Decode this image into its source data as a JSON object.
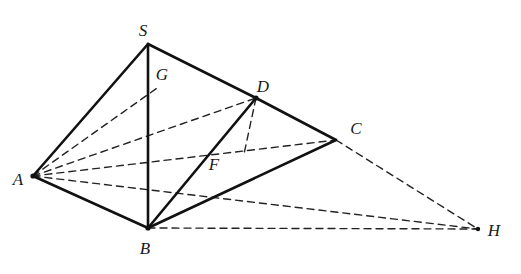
{
  "figure": {
    "title": "",
    "type": "geometry-diagram",
    "stroke_color": "#111111",
    "dashed_color": "#222222",
    "background": "#ffffff",
    "solid_width": 2.6,
    "dashed_width": 1.4,
    "dash_pattern": "7,5",
    "points": {
      "S": {
        "x": 148,
        "y": 44,
        "label": "S",
        "label_x": 143,
        "label_y": 36
      },
      "A": {
        "x": 33,
        "y": 176,
        "label": "A",
        "label_x": 16,
        "label_y": 183
      },
      "B": {
        "x": 148,
        "y": 228,
        "label": "B",
        "label_x": 141,
        "label_y": 252
      },
      "C": {
        "x": 336,
        "y": 140,
        "label": "C",
        "label_x": 353,
        "label_y": 133
      },
      "D": {
        "x": 256,
        "y": 98,
        "label": "D",
        "label_x": 260,
        "label_y": 90
      },
      "G": {
        "x": 160,
        "y": 86,
        "label": "G",
        "label_x": 158,
        "label_y": 80
      },
      "F": {
        "x": 218,
        "y": 152,
        "label": "F",
        "label_x": 210,
        "label_y": 168
      },
      "H": {
        "x": 478,
        "y": 229,
        "label": "H",
        "label_x": 489,
        "label_y": 235
      }
    },
    "solid_edges": [
      {
        "name": "edge-S-A",
        "from": "S",
        "to": "A"
      },
      {
        "name": "edge-S-B",
        "from": "S",
        "to": "B"
      },
      {
        "name": "edge-S-D",
        "from": "S",
        "to": "D"
      },
      {
        "name": "edge-A-B",
        "from": "A",
        "to": "B"
      },
      {
        "name": "edge-B-D",
        "from": "B",
        "to": "D"
      },
      {
        "name": "edge-B-C",
        "from": "B",
        "to": "C"
      },
      {
        "name": "edge-D-C",
        "from": "D",
        "to": "C"
      }
    ],
    "dashed_edges": [
      {
        "name": "edge-A-D",
        "from": "A",
        "to": "D"
      },
      {
        "name": "edge-A-C",
        "from": "A",
        "to": "C"
      },
      {
        "name": "edge-A-H",
        "from": "A",
        "to": "H"
      },
      {
        "name": "edge-A-G",
        "from": "A",
        "to": "G"
      },
      {
        "name": "edge-S-G-B",
        "from": "S",
        "to": "B"
      },
      {
        "name": "edge-D-F",
        "from": "D",
        "to": "F"
      },
      {
        "name": "edge-B-H",
        "from": "B",
        "to": "H"
      },
      {
        "name": "edge-C-H",
        "from": "C",
        "to": "H"
      }
    ],
    "labels": [
      "S",
      "G",
      "D",
      "C",
      "A",
      "F",
      "B",
      "H"
    ]
  }
}
